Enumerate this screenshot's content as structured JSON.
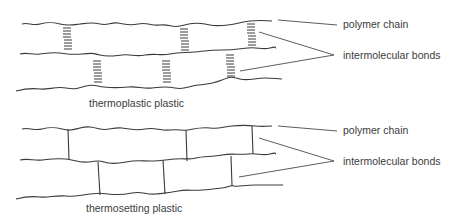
{
  "diagrams": [
    {
      "id": "thermoplastic",
      "caption": "thermoplastic plastic",
      "bond_type": "weak intermolecular (dashed)",
      "labels": {
        "polymer_chain": "polymer chain",
        "intermolecular_bonds": "intermolecular bonds"
      }
    },
    {
      "id": "thermosetting",
      "caption": "thermosetting plastic",
      "bond_type": "cross-link (solid)",
      "labels": {
        "polymer_chain": "polymer chain",
        "intermolecular_bonds": "intermolecular bonds"
      }
    }
  ],
  "colors": {
    "line": "#3a3a3a",
    "text": "#3c3c3c",
    "background": "#ffffff"
  }
}
